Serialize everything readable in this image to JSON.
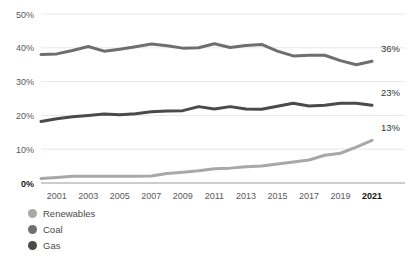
{
  "chart_data": {
    "type": "line",
    "title": "",
    "xlabel": "",
    "ylabel": "",
    "ylim": [
      0,
      50
    ],
    "xlim": [
      2000,
      2021
    ],
    "grid": true,
    "legend_position": "bottom-left",
    "y_ticks": [
      "0%",
      "10%",
      "20%",
      "30%",
      "40%",
      "50%"
    ],
    "y_tick_values": [
      0,
      10,
      20,
      30,
      40,
      50
    ],
    "x_ticks": [
      "2001",
      "2003",
      "2005",
      "2007",
      "2009",
      "2011",
      "2013",
      "2015",
      "2017",
      "2019",
      "2021"
    ],
    "x_tick_values": [
      2001,
      2003,
      2005,
      2007,
      2009,
      2011,
      2013,
      2015,
      2017,
      2019,
      2021
    ],
    "x": [
      2000,
      2001,
      2002,
      2003,
      2004,
      2005,
      2006,
      2007,
      2008,
      2009,
      2010,
      2011,
      2012,
      2013,
      2014,
      2015,
      2016,
      2017,
      2018,
      2019,
      2020,
      2021
    ],
    "series": [
      {
        "name": "Coal",
        "color": "#6e6e6e",
        "end_label": "36%",
        "values": [
          38.0,
          38.2,
          39.2,
          40.4,
          39.0,
          39.6,
          40.3,
          41.1,
          40.6,
          39.9,
          40.0,
          41.2,
          40.1,
          40.7,
          41.0,
          39.0,
          37.6,
          37.8,
          37.8,
          36.2,
          35.0,
          36.0
        ]
      },
      {
        "name": "Gas",
        "color": "#4a4a4a",
        "end_label": "23%",
        "values": [
          18.2,
          19.0,
          19.6,
          20.0,
          20.4,
          20.2,
          20.5,
          21.1,
          21.3,
          21.4,
          22.6,
          21.9,
          22.6,
          21.9,
          21.8,
          22.7,
          23.6,
          22.8,
          23.0,
          23.6,
          23.6,
          23.0
        ]
      },
      {
        "name": "Renewables",
        "color": "#a8a8a8",
        "end_label": "13%",
        "values": [
          1.3,
          1.6,
          2.0,
          2.0,
          2.0,
          2.0,
          2.0,
          2.1,
          2.8,
          3.2,
          3.6,
          4.2,
          4.4,
          4.8,
          5.0,
          5.6,
          6.2,
          6.8,
          8.2,
          8.8,
          10.6,
          12.6
        ]
      }
    ]
  },
  "legend": {
    "items": [
      {
        "label": "Renewables",
        "color": "#a8a8a8"
      },
      {
        "label": "Coal",
        "color": "#6e6e6e"
      },
      {
        "label": "Gas",
        "color": "#4a4a4a"
      }
    ]
  }
}
